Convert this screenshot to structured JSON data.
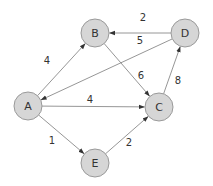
{
  "diagram": {
    "type": "directed-weighted-graph",
    "node_style": {
      "fill": "#d6d6d6",
      "stroke": "#9a9a9a",
      "radius": 14
    },
    "edge_color": "#8a8a8a",
    "text_color": "#333333",
    "nodes": [
      {
        "id": "A",
        "label": "A",
        "x": 28,
        "y": 106
      },
      {
        "id": "B",
        "label": "B",
        "x": 95,
        "y": 33
      },
      {
        "id": "C",
        "label": "C",
        "x": 159,
        "y": 107
      },
      {
        "id": "D",
        "label": "D",
        "x": 185,
        "y": 33
      },
      {
        "id": "E",
        "label": "E",
        "x": 95,
        "y": 163
      }
    ],
    "edges": [
      {
        "from": "A",
        "to": "B",
        "weight": "4",
        "label_x": 47,
        "label_y": 60
      },
      {
        "from": "D",
        "to": "B",
        "weight": "2",
        "label_x": 143,
        "label_y": 17
      },
      {
        "from": "D",
        "to": "A",
        "weight": "5",
        "label_x": 140,
        "label_y": 40
      },
      {
        "from": "B",
        "to": "C",
        "weight": "6",
        "label_x": 141,
        "label_y": 75
      },
      {
        "from": "A",
        "to": "C",
        "weight": "4",
        "label_x": 90,
        "label_y": 99
      },
      {
        "from": "C",
        "to": "D",
        "weight": "8",
        "label_x": 178,
        "label_y": 80
      },
      {
        "from": "A",
        "to": "E",
        "weight": "1",
        "label_x": 52,
        "label_y": 140
      },
      {
        "from": "E",
        "to": "C",
        "weight": "2",
        "label_x": 129,
        "label_y": 142
      }
    ]
  }
}
